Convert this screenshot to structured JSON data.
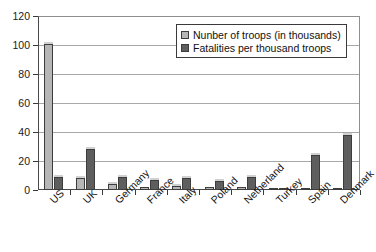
{
  "chart_data": {
    "type": "bar",
    "title": "",
    "xlabel": "",
    "ylabel": "",
    "ylim": [
      0,
      120
    ],
    "yticks": [
      0,
      20,
      40,
      60,
      80,
      100,
      120
    ],
    "grid": true,
    "legend_position": "top-right",
    "categories": [
      "US",
      "UK",
      "Germany",
      "France",
      "Italy",
      "Poland",
      "Netherland",
      "Turkey",
      "Spain",
      "Denmark"
    ],
    "series": [
      {
        "name": "Nunber of troops (in thousands)",
        "color": "#b6b6b6",
        "values": [
          101,
          8,
          4,
          2,
          3,
          2,
          2,
          1,
          0.5,
          0.5
        ]
      },
      {
        "name": "Fatalities per thousand troops",
        "color": "#5e5e5e",
        "values": [
          9,
          28,
          9,
          7,
          8,
          6,
          9,
          1.5,
          24,
          38
        ]
      }
    ]
  },
  "axis": {
    "y_tick_labels": [
      "0",
      "20",
      "40",
      "60",
      "80",
      "100",
      "120"
    ]
  },
  "legend": {
    "items": [
      {
        "label": "Nunber of troops (in thousands)",
        "swatch": "light-gray-swatch"
      },
      {
        "label": "Fatalities per thousand troops",
        "swatch": "dark-gray-swatch"
      }
    ]
  }
}
